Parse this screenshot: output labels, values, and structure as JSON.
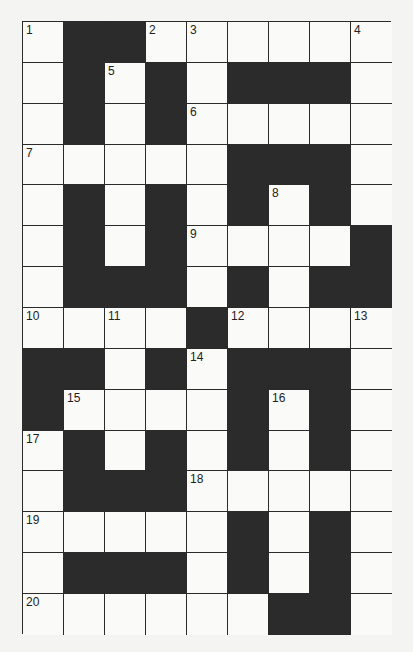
{
  "puzzle": {
    "rows": 15,
    "cols": 9,
    "colors": {
      "black_cell": "#2b2b2b",
      "white_cell": "#fafaf8",
      "grid_line": "#2a2a2a",
      "background": "#f4f4f2"
    },
    "grid": [
      [
        "1",
        "#",
        "#",
        "2",
        "3",
        "",
        "",
        "",
        "4"
      ],
      [
        "",
        "#",
        "5",
        "#",
        "",
        "#",
        "#",
        "#",
        ""
      ],
      [
        "",
        "#",
        "",
        "#",
        "6",
        "",
        "",
        "",
        ""
      ],
      [
        "7",
        "",
        "",
        "",
        "",
        "#",
        "#",
        "#",
        ""
      ],
      [
        "",
        "#",
        "",
        "#",
        "",
        "#",
        "8",
        "#",
        ""
      ],
      [
        "",
        "#",
        "",
        "#",
        "9",
        "",
        "",
        "",
        "#"
      ],
      [
        "",
        "#",
        "#",
        "#",
        "",
        "#",
        "",
        "#",
        "#"
      ],
      [
        "10",
        "",
        "11",
        "",
        "#",
        "12",
        "",
        "",
        "13"
      ],
      [
        "#",
        "#",
        "",
        "#",
        "14",
        "#",
        "#",
        "#",
        ""
      ],
      [
        "#",
        "15",
        "",
        "",
        "",
        "#",
        "16",
        "#",
        ""
      ],
      [
        "17",
        "#",
        "",
        "#",
        "",
        "#",
        "",
        "#",
        ""
      ],
      [
        "",
        "#",
        "#",
        "#",
        "18",
        "",
        "",
        "",
        ""
      ],
      [
        "19",
        "",
        "",
        "",
        "",
        "#",
        "",
        "#",
        ""
      ],
      [
        "",
        "#",
        "#",
        "#",
        "",
        "#",
        "",
        "#",
        ""
      ],
      [
        "20",
        "",
        "",
        "",
        "",
        "",
        "#",
        "#",
        ""
      ]
    ]
  }
}
